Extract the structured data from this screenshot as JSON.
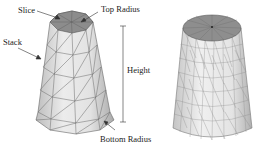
{
  "labels": {
    "slice": "Slice",
    "top_radius": "Top Radius",
    "stack": "Stack",
    "height": "Height",
    "bottom_radius": "Bottom Radius"
  },
  "colors": {
    "top_cap": "#8a8a8a",
    "side_light": "#e6e6e6",
    "side_dark": "#b5b5b5",
    "edge": "#555555"
  }
}
